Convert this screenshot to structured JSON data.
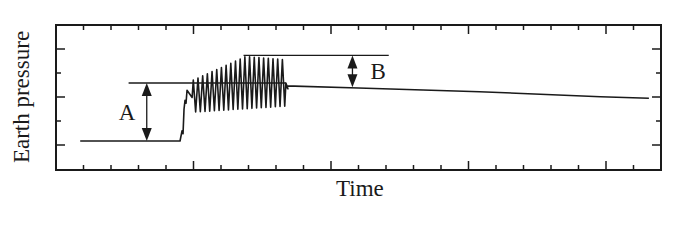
{
  "chart_data": {
    "type": "line",
    "title": "",
    "xlabel": "Time",
    "ylabel": "Earth pressure",
    "grid": false,
    "legend": null,
    "x_ticks": {
      "count_minor": 21,
      "major_every": 5,
      "labels": []
    },
    "y_ticks": {
      "count": 5,
      "labels": []
    },
    "xlim": [
      0,
      100
    ],
    "ylim": [
      0,
      100
    ],
    "series": [
      {
        "name": "Earth pressure",
        "segments": [
          {
            "phase": "initial",
            "x": [
              4,
              20.5
            ],
            "y": [
              20,
              20
            ]
          },
          {
            "phase": "rise",
            "x": [
              20.5,
              22.5
            ],
            "y": [
              20,
              55
            ]
          },
          {
            "phase": "cyclic",
            "x_start": 22.5,
            "x_end": 38,
            "cycles": 20,
            "upper_envelope": [
              62,
              78
            ],
            "lower_envelope": [
              48,
              52
            ]
          },
          {
            "phase": "decay",
            "x": [
              38,
              50,
              70,
              90,
              98
            ],
            "y": [
              58,
              56.5,
              54,
              50.5,
              49.5
            ]
          }
        ]
      }
    ],
    "annotations": [
      {
        "label": "A",
        "type": "double-arrow",
        "x": 15,
        "y_from": 20,
        "y_to": 60,
        "ref_line_x": [
          12,
          38
        ],
        "ref_line_y": 60
      },
      {
        "label": "B",
        "type": "double-arrow",
        "x": 49,
        "y_from": 57,
        "y_to": 79,
        "ref_line_x": [
          31,
          55
        ],
        "ref_line_y": 79
      }
    ]
  }
}
